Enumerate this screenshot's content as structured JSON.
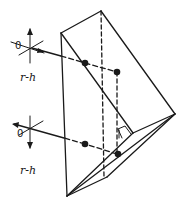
{
  "diagram": {
    "title": "",
    "labels": {
      "top_axis": "r-h",
      "bottom_axis": "r-h",
      "top_zero": "0",
      "bottom_zero": "0"
    },
    "colors": {
      "stroke": "#1a1a1a",
      "background": "#ffffff"
    },
    "elements": [
      "prism-outline",
      "hidden-edge-dashed",
      "incoming-ray-top",
      "outgoing-ray-bottom",
      "reflection-points",
      "right-angle-marker",
      "coordinate-axes-top",
      "coordinate-axes-bottom"
    ]
  }
}
